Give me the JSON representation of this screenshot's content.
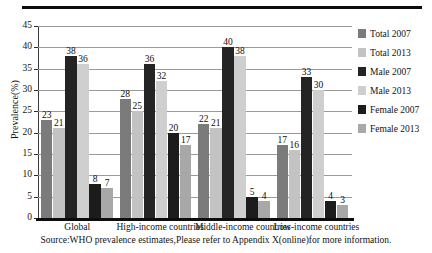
{
  "figure": {
    "ylabel": "Prevalence(%)",
    "source_note": "Source:WHO prevalence estimates,Please refer to Appendix X(online)for more information."
  },
  "legend": {
    "position": "right",
    "items": [
      {
        "label": "Total 2007",
        "color": "#7b7b7b"
      },
      {
        "label": "Total 2013",
        "color": "#c3c3c3"
      },
      {
        "label": "Male 2007",
        "color": "#242424"
      },
      {
        "label": "Male 2013",
        "color": "#cfcfcf"
      },
      {
        "label": "Female 2007",
        "color": "#1c1c1c"
      },
      {
        "label": "Female 2013",
        "color": "#a8a8a8"
      }
    ]
  },
  "chart_data": {
    "type": "bar",
    "title": "",
    "xlabel": "",
    "ylabel": "Prevalence(%)",
    "ylim": [
      0,
      45
    ],
    "yticks": [
      0,
      5,
      10,
      15,
      20,
      25,
      30,
      35,
      40,
      45
    ],
    "grid": true,
    "categories": [
      "Global",
      "High-income countries",
      "Middle-income countries",
      "Low-income countries"
    ],
    "series": [
      {
        "name": "Total 2007",
        "color": "#7b7b7b",
        "values": [
          23,
          28,
          22,
          17
        ]
      },
      {
        "name": "Total 2013",
        "color": "#c3c3c3",
        "values": [
          21,
          25,
          21,
          16
        ]
      },
      {
        "name": "Male 2007",
        "color": "#242424",
        "values": [
          38,
          36,
          40,
          33
        ]
      },
      {
        "name": "Male 2013",
        "color": "#cfcfcf",
        "values": [
          36,
          32,
          38,
          30
        ]
      },
      {
        "name": "Female 2007",
        "color": "#1c1c1c",
        "values": [
          8,
          20,
          5,
          4
        ]
      },
      {
        "name": "Female 2013",
        "color": "#a8a8a8",
        "values": [
          7,
          17,
          4,
          3
        ]
      }
    ]
  }
}
